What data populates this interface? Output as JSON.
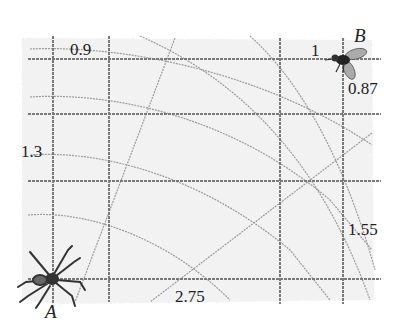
{
  "figure": {
    "type": "spider-web-grid-diagram",
    "points": {
      "A": {
        "label": "A",
        "creature": "spider",
        "x": 53,
        "y": 279
      },
      "B": {
        "label": "B",
        "creature": "fly",
        "x": 343,
        "y": 59
      }
    },
    "grid": {
      "vertical_lines_x": [
        53,
        109,
        280,
        343
      ],
      "horizontal_lines_y": [
        59,
        114,
        181,
        279
      ],
      "color": "#777777"
    },
    "labels": {
      "top_segment": "0.9",
      "top_right_segment": "1",
      "right_upper_segment": "0.87",
      "left_segment": "1.3",
      "right_lower_segment": "1.55",
      "bottom_segment": "2.75"
    },
    "colors": {
      "background": "#f4f4f4",
      "grid": "#7a7a7a",
      "arc": "#9a9a9a",
      "text": "#222222"
    }
  }
}
